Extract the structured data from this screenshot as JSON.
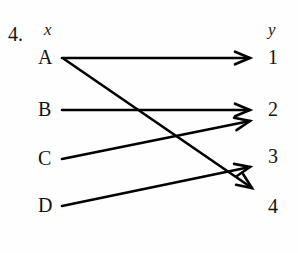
{
  "problem": {
    "number": "4."
  },
  "headers": {
    "left": "x",
    "right": "y"
  },
  "domain_nodes": [
    {
      "label": "A",
      "x": 62,
      "y": 58
    },
    {
      "label": "B",
      "x": 62,
      "y": 110
    },
    {
      "label": "C",
      "x": 62,
      "y": 158
    },
    {
      "label": "D",
      "x": 62,
      "y": 205
    }
  ],
  "range_nodes": [
    {
      "label": "1",
      "x": 258,
      "y": 58
    },
    {
      "label": "2",
      "x": 258,
      "y": 110
    },
    {
      "label": "3",
      "x": 258,
      "y": 158
    },
    {
      "label": "4",
      "x": 258,
      "y": 205
    }
  ],
  "arrows": [
    {
      "name": "arrow-a-to-1",
      "from": "A",
      "to": "1",
      "x1": 62,
      "y1": 58,
      "x2": 250,
      "y2": 58
    },
    {
      "name": "arrow-a-to-4",
      "from": "A",
      "to": "4",
      "x1": 64,
      "y1": 59,
      "x2": 252,
      "y2": 188
    },
    {
      "name": "arrow-b-to-2",
      "from": "B",
      "to": "2",
      "x1": 62,
      "y1": 110,
      "x2": 250,
      "y2": 110
    },
    {
      "name": "arrow-c-to-2",
      "from": "C",
      "to": "2",
      "x1": 62,
      "y1": 159,
      "x2": 250,
      "y2": 121
    },
    {
      "name": "arrow-d-to-3",
      "from": "D",
      "to": "3",
      "x1": 62,
      "y1": 206,
      "x2": 250,
      "y2": 167
    }
  ],
  "style": {
    "ink": "#000000",
    "background": "#fefefe",
    "line_width": 2.6
  }
}
